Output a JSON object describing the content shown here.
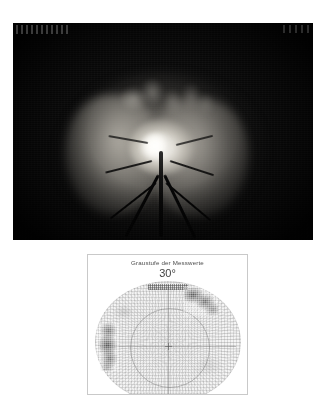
{
  "page": {
    "background_color": "#ffffff",
    "width": 326,
    "height": 397
  },
  "fundus_photo": {
    "name": "fundus-photograph",
    "description": "Retinal fundus photograph showing optic disc",
    "background_color": "#0a0a0a",
    "corner_marks_visible": true
  },
  "field_panel": {
    "title": "Graustufe der Messwerte",
    "degree_label": "30°",
    "border_color": "#c9c9c9",
    "background_color": "#ffffff",
    "bottom_left_label": "",
    "bottom_right_label": ""
  },
  "chart_data": {
    "type": "heatmap",
    "title": "Graustufe der Messwerte",
    "subtitle": "30°",
    "xlabel": "",
    "ylabel": "",
    "projection": "polar",
    "field_radius_degrees": 30,
    "grid": true,
    "legend": "none",
    "colormap": "grayscale",
    "colormap_note": "dark = reduced sensitivity (scotoma), light = normal sensitivity",
    "inner_circle_degrees": 10,
    "regions": [
      {
        "name": "superior-nasal-scotoma",
        "position": "upper-right",
        "center_deg": [
          12,
          20
        ],
        "extent_deg": [
          14,
          12
        ],
        "gray_level": 0.25,
        "severity": "dense"
      },
      {
        "name": "arcuate-temporal-defect",
        "position": "left",
        "center_deg": [
          -22,
          -2
        ],
        "extent_deg": [
          8,
          20
        ],
        "gray_level": 0.22,
        "severity": "dense"
      },
      {
        "name": "relative-defect-superior",
        "position": "upper-left",
        "center_deg": [
          -16,
          14
        ],
        "extent_deg": [
          8,
          6
        ],
        "gray_level": 0.78,
        "severity": "relative"
      },
      {
        "name": "relative-defect-inferior-nasal",
        "position": "lower-right",
        "center_deg": [
          12,
          -8
        ],
        "extent_deg": [
          10,
          8
        ],
        "gray_level": 0.84,
        "severity": "relative"
      }
    ],
    "background_gray_level": 0.95
  }
}
